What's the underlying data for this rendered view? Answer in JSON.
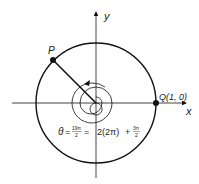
{
  "diagram": {
    "axes": {
      "x_label": "x",
      "y_label": "y"
    },
    "points": {
      "P": {
        "label": "P"
      },
      "Q": {
        "label": "Q(1, 0)"
      }
    },
    "formula": {
      "theta": "θ",
      "eq1": "=",
      "frac1_num": "19π",
      "frac1_den": "2",
      "eq2": "=",
      "middle": "2(2π)",
      "plus": "+",
      "frac2_num": "3π",
      "frac2_den": "2"
    },
    "colors": {
      "stroke": "#111111",
      "background": "#ffffff"
    }
  }
}
